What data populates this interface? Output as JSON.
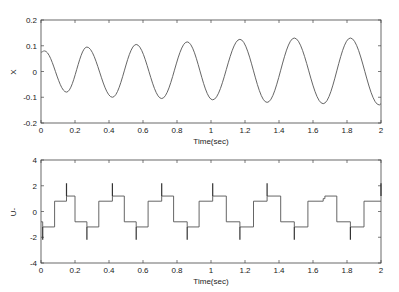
{
  "chart_data": [
    {
      "type": "line",
      "title": "",
      "xlabel": "Time(sec)",
      "ylabel": "X",
      "xlim": [
        0,
        2
      ],
      "ylim": [
        -0.2,
        0.2
      ],
      "xticks": [
        "0",
        "0.2",
        "0.4",
        "0.6",
        "0.8",
        "1",
        "1.2",
        "1.4",
        "1.6",
        "1.8",
        "2"
      ],
      "yticks": [
        "0.2",
        "0.1",
        "0",
        "-0.1",
        "-0.2"
      ],
      "grid": false,
      "series": [
        {
          "name": "X",
          "description": "growing oscillation, period ~0.3 s",
          "peaks": [
            [
              0.02,
              0.08
            ],
            [
              0.27,
              0.095
            ],
            [
              0.56,
              0.105
            ],
            [
              0.86,
              0.115
            ],
            [
              1.17,
              0.125
            ],
            [
              1.49,
              0.13
            ],
            [
              1.82,
              0.13
            ]
          ],
          "troughs": [
            [
              0.15,
              -0.08
            ],
            [
              0.42,
              -0.1
            ],
            [
              0.71,
              -0.105
            ],
            [
              1.01,
              -0.11
            ],
            [
              1.33,
              -0.12
            ],
            [
              1.66,
              -0.125
            ],
            [
              1.99,
              -0.13
            ]
          ]
        }
      ]
    },
    {
      "type": "line",
      "title": "",
      "xlabel": "Time(sec)",
      "ylabel": "U-",
      "xlim": [
        0,
        2
      ],
      "ylim": [
        -4,
        4
      ],
      "xticks": [
        "0",
        "0.2",
        "0.4",
        "0.6",
        "0.8",
        "1",
        "1.2",
        "1.4",
        "1.6",
        "1.8",
        "2"
      ],
      "yticks": [
        "4",
        "2",
        "0",
        "-2",
        "-4"
      ],
      "grid": false,
      "series": [
        {
          "name": "U-",
          "description": "staircase control signal with spikes at switching instants",
          "levels": [
            -1.2,
            0.8,
            1.2,
            -0.8
          ],
          "spikes": [
            [
              0.01,
              -2.2
            ],
            [
              0.15,
              2.2
            ],
            [
              0.27,
              -2.2
            ],
            [
              0.42,
              2.2
            ],
            [
              0.56,
              -2.2
            ],
            [
              0.71,
              2.2
            ],
            [
              0.86,
              -2.2
            ],
            [
              1.01,
              2.2
            ],
            [
              1.17,
              -2.2
            ],
            [
              1.33,
              2.2
            ],
            [
              1.49,
              -2.2
            ],
            [
              1.82,
              -2.2
            ],
            [
              2.0,
              2.2
            ]
          ],
          "steps": [
            [
              0.0,
              -0.8
            ],
            [
              0.01,
              -1.2
            ],
            [
              0.08,
              0.8
            ],
            [
              0.15,
              1.2
            ],
            [
              0.2,
              -0.8
            ],
            [
              0.27,
              -1.2
            ],
            [
              0.34,
              0.8
            ],
            [
              0.42,
              1.2
            ],
            [
              0.49,
              -0.8
            ],
            [
              0.56,
              -1.2
            ],
            [
              0.63,
              0.8
            ],
            [
              0.71,
              1.2
            ],
            [
              0.78,
              -0.8
            ],
            [
              0.86,
              -1.2
            ],
            [
              0.93,
              0.8
            ],
            [
              1.01,
              1.2
            ],
            [
              1.09,
              -0.8
            ],
            [
              1.17,
              -1.2
            ],
            [
              1.25,
              0.8
            ],
            [
              1.33,
              1.2
            ],
            [
              1.41,
              -0.8
            ],
            [
              1.49,
              -1.2
            ],
            [
              1.57,
              0.8
            ],
            [
              1.66,
              1.0
            ],
            [
              1.67,
              1.2
            ],
            [
              1.74,
              -0.8
            ],
            [
              1.82,
              -1.2
            ],
            [
              1.9,
              0.8
            ],
            [
              2.0,
              0.8
            ]
          ]
        }
      ]
    }
  ],
  "labels": {
    "top_xlabel": "Time(sec)",
    "top_ylabel": "X",
    "bottom_xlabel": "Time(sec)",
    "bottom_ylabel": "U-"
  },
  "colors": {
    "line": "#555555",
    "axes": "#444444",
    "background": "#ffffff"
  }
}
